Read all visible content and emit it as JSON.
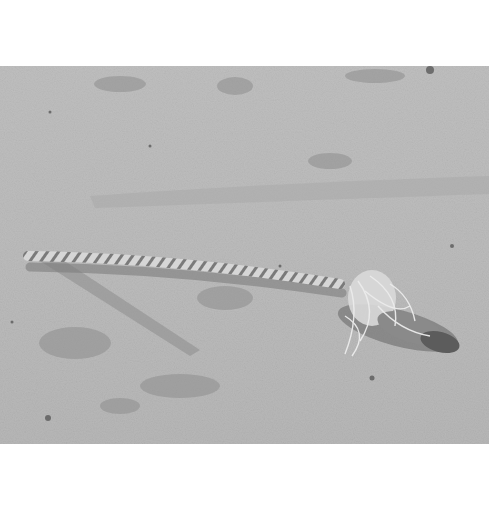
{
  "photo": {
    "subject": "frayed rope lying on sand",
    "colors": {
      "sand_light": "#c8c8c8",
      "sand_mid": "#b4b4b4",
      "sand_dark": "#8c8c8c",
      "rope_light": "#e2e2e2",
      "rope_dark": "#6e6e6e",
      "background": "#ffffff"
    }
  }
}
